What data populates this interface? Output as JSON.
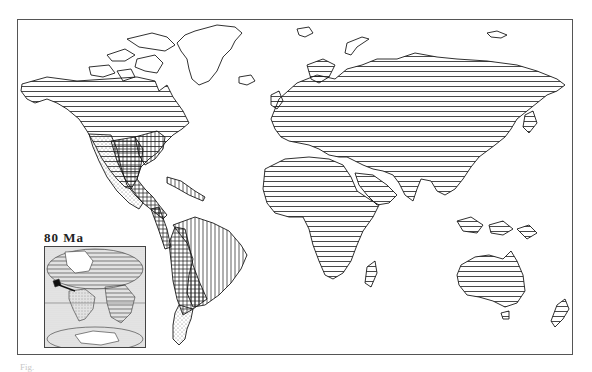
{
  "figure": {
    "type": "world paleogeographic/biogeographic map",
    "caption_visible": "Fig.",
    "colors": {
      "ink": "#1a1a1a",
      "frame": "#555555",
      "background": "#ffffff",
      "stipple_gray": "#bdbdbd"
    }
  },
  "main_map": {
    "patterns": [
      {
        "id": "horizontal-lines",
        "regions": [
          "North America (southern Canada, USA)",
          "Europe",
          "Asia",
          "Africa",
          "Arabia",
          "India",
          "Southeast Asia",
          "Japan",
          "Madagascar",
          "Australia",
          "New Zealand",
          "Indonesia"
        ]
      },
      {
        "id": "outline-only",
        "regions": [
          "Greenland",
          "Canadian Arctic Archipelago",
          "Iceland",
          "Svalbard",
          "Novaya Zemlya",
          "Siberian islands"
        ]
      },
      {
        "id": "vertical-lines",
        "regions": [
          "eastern South America (Brazil)",
          "Caribbean arc",
          "eastern USA"
        ]
      },
      {
        "id": "crosshatch",
        "regions": [
          "western/central South America",
          "Mexico",
          "Central America"
        ]
      },
      {
        "id": "stipple",
        "regions": [
          "southern South America (Patagonia)",
          "western Mexico",
          "SW USA"
        ]
      }
    ]
  },
  "inset": {
    "label": "80 Ma",
    "description": "Late Cretaceous paleogeography of Atlantic region"
  }
}
